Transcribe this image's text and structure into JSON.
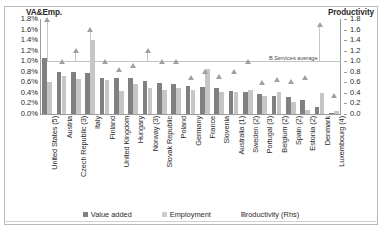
{
  "axes": {
    "left_title": "VA&Emp.",
    "right_title": "Productivity",
    "left_ticks": [
      "1.8%",
      "1.6%",
      "1.4%",
      "1.2%",
      "1.0%",
      "0.8%",
      "0.6%",
      "0.4%",
      "0.2%",
      "0.0%"
    ],
    "right_ticks": [
      "1.8",
      "1.6",
      "1.4",
      "1.2",
      "1.0",
      "0.8",
      "0.6",
      "0.4",
      "0.2",
      "0.0"
    ]
  },
  "annotation": {
    "reference_label": "B.Services average",
    "reference_value": 1.0
  },
  "legend": {
    "items": [
      {
        "label": "Value added",
        "icon": "square-swatch-dark",
        "color": "#808080"
      },
      {
        "label": "Employment",
        "icon": "square-swatch-light",
        "color": "#cccccc"
      },
      {
        "label": "Productivity (Rhs)",
        "icon": "triangle-marker",
        "color": "#a0a0a0"
      }
    ]
  },
  "chart_data": {
    "type": "bar",
    "title": "",
    "xlabel": "",
    "ylabel": "VA&Emp.",
    "ylabel_secondary": "Productivity",
    "ylim": [
      0.0,
      1.8
    ],
    "ylim_secondary": [
      0.0,
      1.8
    ],
    "grid": false,
    "legend_position": "bottom",
    "categories": [
      "United States (5)",
      "Austria",
      "Czech Republic (3)",
      "Italy",
      "Finland",
      "United Kingdom",
      "Hungary",
      "Norway (3)",
      "Slovak Republic",
      "Poland",
      "Germany",
      "France",
      "Slovenia",
      "Australia (1)",
      "Sweden (2)",
      "Portugal (3)",
      "Belgium (2)",
      "Spain (2)",
      "Estonia (2)",
      "Denmark",
      "Luxembourg (4)"
    ],
    "series": [
      {
        "name": "Value added",
        "axis": "left",
        "color": "#808080",
        "values": [
          1.06,
          0.8,
          0.8,
          0.78,
          0.68,
          0.68,
          0.68,
          0.62,
          0.58,
          0.56,
          0.54,
          0.52,
          0.5,
          0.44,
          0.42,
          0.38,
          0.34,
          0.32,
          0.26,
          0.14,
          0.02
        ]
      },
      {
        "name": "Employment",
        "axis": "left",
        "color": "#c6c6c6",
        "values": [
          0.6,
          0.72,
          0.66,
          1.4,
          0.64,
          0.44,
          0.56,
          0.5,
          0.46,
          0.5,
          0.46,
          0.86,
          0.42,
          0.42,
          0.46,
          0.34,
          0.42,
          0.22,
          0.08,
          0.4,
          0.06
        ]
      },
      {
        "name": "Productivity (Rhs)",
        "axis": "right",
        "type": "scatter",
        "color": "#a0a0a0",
        "values": [
          1.8,
          1.0,
          1.2,
          1.6,
          1.0,
          0.85,
          0.92,
          1.2,
          1.0,
          1.0,
          0.7,
          0.8,
          0.72,
          0.8,
          1.0,
          0.6,
          0.65,
          0.62,
          0.7,
          1.7,
          0.35
        ]
      }
    ]
  }
}
